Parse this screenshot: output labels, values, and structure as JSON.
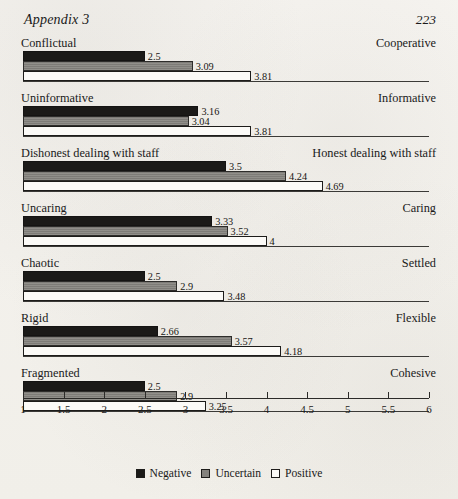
{
  "header": {
    "appendix_title": "Appendix 3",
    "page_number": "223"
  },
  "legend": {
    "items": [
      {
        "label": "Negative",
        "swatch": "negative-swatch",
        "color": "#1b1a18"
      },
      {
        "label": "Uncertain",
        "swatch": "uncertain-swatch",
        "color": "#84827d"
      },
      {
        "label": "Positive",
        "swatch": "positive-swatch",
        "color": "#fbfaf7"
      }
    ]
  },
  "axis": {
    "ticks": [
      "1",
      "1.5",
      "2",
      "2.5",
      "3",
      "3.5",
      "4",
      "4.5",
      "5",
      "5.5",
      "6"
    ]
  },
  "chart_data": {
    "type": "bar",
    "orientation": "horizontal",
    "title": "",
    "subtitle": "",
    "xlabel": "",
    "ylabel": "",
    "xlim": [
      1,
      6
    ],
    "xticks": [
      1,
      1.5,
      2,
      2.5,
      3,
      3.5,
      4,
      4.5,
      5,
      5.5,
      6
    ],
    "grid": false,
    "legend_position": "bottom-center",
    "legend": [
      "Negative",
      "Uncertain",
      "Positive"
    ],
    "categories": [
      "Conflictual / Cooperative",
      "Uninformative / Informative",
      "Dishonest dealing with staff / Honest dealing with staff",
      "Uncaring / Caring",
      "Chaotic / Settled",
      "Rigid / Flexible",
      "Fragmented / Cohesive"
    ],
    "series": [
      {
        "name": "Negative",
        "values": [
          2.5,
          3.16,
          3.5,
          3.33,
          2.5,
          2.66,
          2.5
        ]
      },
      {
        "name": "Uncertain",
        "values": [
          3.09,
          3.04,
          4.24,
          3.52,
          2.9,
          3.57,
          2.9
        ]
      },
      {
        "name": "Positive",
        "values": [
          3.81,
          3.81,
          4.69,
          4.0,
          3.48,
          4.18,
          3.25
        ]
      }
    ],
    "groups": [
      {
        "left_label": "Conflictual",
        "right_label": "Cooperative",
        "bars": [
          {
            "series": "Negative",
            "value": 2.5,
            "value_label": "2.5"
          },
          {
            "series": "Uncertain",
            "value": 3.09,
            "value_label": "3.09"
          },
          {
            "series": "Positive",
            "value": 3.81,
            "value_label": "3.81"
          }
        ]
      },
      {
        "left_label": "Uninformative",
        "right_label": "Informative",
        "bars": [
          {
            "series": "Negative",
            "value": 3.16,
            "value_label": "3.16"
          },
          {
            "series": "Uncertain",
            "value": 3.04,
            "value_label": "3.04"
          },
          {
            "series": "Positive",
            "value": 3.81,
            "value_label": "3.81"
          }
        ]
      },
      {
        "left_label": "Dishonest dealing with staff",
        "right_label": "Honest dealing with staff",
        "bars": [
          {
            "series": "Negative",
            "value": 3.5,
            "value_label": "3.5"
          },
          {
            "series": "Uncertain",
            "value": 4.24,
            "value_label": "4.24"
          },
          {
            "series": "Positive",
            "value": 4.69,
            "value_label": "4.69"
          }
        ]
      },
      {
        "left_label": "Uncaring",
        "right_label": "Caring",
        "bars": [
          {
            "series": "Negative",
            "value": 3.33,
            "value_label": "3.33"
          },
          {
            "series": "Uncertain",
            "value": 3.52,
            "value_label": "3.52"
          },
          {
            "series": "Positive",
            "value": 4.0,
            "value_label": "4"
          }
        ]
      },
      {
        "left_label": "Chaotic",
        "right_label": "Settled",
        "bars": [
          {
            "series": "Negative",
            "value": 2.5,
            "value_label": "2.5"
          },
          {
            "series": "Uncertain",
            "value": 2.9,
            "value_label": "2.9"
          },
          {
            "series": "Positive",
            "value": 3.48,
            "value_label": "3.48"
          }
        ]
      },
      {
        "left_label": "Rigid",
        "right_label": "Flexible",
        "bars": [
          {
            "series": "Negative",
            "value": 2.66,
            "value_label": "2.66"
          },
          {
            "series": "Uncertain",
            "value": 3.57,
            "value_label": "3.57"
          },
          {
            "series": "Positive",
            "value": 4.18,
            "value_label": "4.18"
          }
        ]
      },
      {
        "left_label": "Fragmented",
        "right_label": "Cohesive",
        "bars": [
          {
            "series": "Negative",
            "value": 2.5,
            "value_label": "2.5"
          },
          {
            "series": "Uncertain",
            "value": 2.9,
            "value_label": "2.9"
          },
          {
            "series": "Positive",
            "value": 3.25,
            "value_label": "3.25"
          }
        ]
      }
    ]
  }
}
